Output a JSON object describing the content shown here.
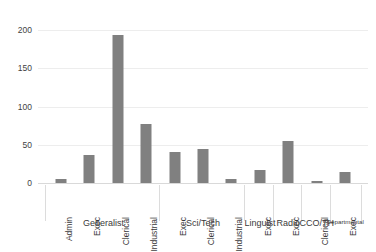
{
  "chart_data": {
    "type": "bar",
    "title": "",
    "subtitle": "",
    "xlabel": "",
    "ylabel": "",
    "ylim": [
      0,
      200
    ],
    "yticks": [
      0,
      50,
      100,
      150,
      200
    ],
    "ytick_labels": [
      "0",
      "50",
      "100",
      "150",
      "200"
    ],
    "grid": true,
    "legend": "none",
    "bar_color": "#808080",
    "orientation": "vertical",
    "categories": [
      "Admin",
      "Exec",
      "Clerical",
      "Industrial",
      "Exec",
      "Clerical",
      "Industrial",
      "Exec",
      "Exec",
      "Clerical",
      "Exec"
    ],
    "values": [
      5,
      37,
      193,
      77,
      40,
      45,
      5,
      17,
      55,
      2,
      14
    ],
    "groups": [
      {
        "label": "Generalist",
        "categories": [
          "Admin",
          "Exec",
          "Clerical",
          "Industrial"
        ],
        "values": [
          5,
          37,
          193,
          77
        ]
      },
      {
        "label": "Sci/Tech",
        "categories": [
          "Exec",
          "Clerical",
          "Industrial"
        ],
        "values": [
          40,
          45,
          5
        ]
      },
      {
        "label": "Linguist",
        "categories": [
          "Exec"
        ],
        "values": [
          17
        ]
      },
      {
        "label": "Radio",
        "categories": [
          "Exec"
        ],
        "values": [
          55
        ]
      },
      {
        "label": "CCO/TH",
        "categories": [
          "Clerical"
        ],
        "values": [
          2
        ]
      },
      {
        "label": "Departmental",
        "categories": [
          "Exec"
        ],
        "values": [
          14
        ]
      }
    ]
  },
  "axis": {
    "yticks": [
      {
        "label": "200",
        "value": 200
      },
      {
        "label": "150",
        "value": 150
      },
      {
        "label": "100",
        "value": 100
      },
      {
        "label": "50",
        "value": 50
      },
      {
        "label": "0",
        "value": 0
      }
    ]
  },
  "bars": [
    {
      "label": "Admin",
      "value": 5,
      "group": "Generalist"
    },
    {
      "label": "Exec",
      "value": 37,
      "group": "Generalist"
    },
    {
      "label": "Clerical",
      "value": 193,
      "group": "Generalist"
    },
    {
      "label": "Industrial",
      "value": 77,
      "group": "Generalist"
    },
    {
      "label": "Exec",
      "value": 40,
      "group": "Sci/Tech"
    },
    {
      "label": "Clerical",
      "value": 45,
      "group": "Sci/Tech"
    },
    {
      "label": "Industrial",
      "value": 5,
      "group": "Sci/Tech"
    },
    {
      "label": "Exec",
      "value": 17,
      "group": "Linguist"
    },
    {
      "label": "Exec",
      "value": 55,
      "group": "Radio"
    },
    {
      "label": "Clerical",
      "value": 2,
      "group": "CCO/TH"
    },
    {
      "label": "Exec",
      "value": 14,
      "group": "Departmental"
    }
  ],
  "group_labels": [
    {
      "label": "Generalist",
      "small": false
    },
    {
      "label": "Sci/Tech",
      "small": false
    },
    {
      "label": "Linguist",
      "small": false
    },
    {
      "label": "Radio",
      "small": false
    },
    {
      "label": "CCO/TH",
      "small": false
    },
    {
      "label": "Departmental",
      "small": true
    }
  ]
}
